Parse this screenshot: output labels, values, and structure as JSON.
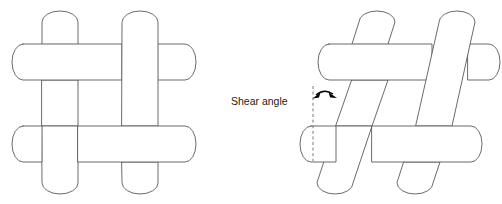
{
  "figure": {
    "canvas": {
      "width": 502,
      "height": 204,
      "background": "#ffffff"
    },
    "style": {
      "tow_fill": "#ffffff",
      "tow_stroke": "#5a5a5a",
      "tow_stroke_width": 0.9,
      "annotation_color": "#000000",
      "dashed_reference_color": "#6a6a6a",
      "text_color": "#1b1b1b"
    },
    "annotations": [
      {
        "name": "shear-angle-label",
        "text": "Shear angle",
        "x": 231,
        "y": 105,
        "font_size": 10.5
      }
    ],
    "panels": [
      {
        "name": "undeformed-plain-weave",
        "label": "",
        "shear_angle_deg": 0,
        "description": "Plain-weave unit cell of four tows, orthogonal (0 degree shear)",
        "tow_width": 36,
        "weave": "plain",
        "warp_tows": [
          {
            "name": "warp-left",
            "axis": "vertical",
            "center": 60,
            "x_min": 42,
            "x_max": 78,
            "y_min": 14,
            "y_max": 194
          },
          {
            "name": "warp-right",
            "axis": "vertical",
            "center": 140,
            "x_min": 122,
            "x_max": 158,
            "y_min": 14,
            "y_max": 194
          }
        ],
        "weft_tows": [
          {
            "name": "weft-top",
            "axis": "horizontal",
            "center": 62,
            "y_min": 44,
            "y_max": 80,
            "x_min": 12,
            "x_max": 196
          },
          {
            "name": "weft-bottom",
            "axis": "horizontal",
            "center": 144,
            "y_min": 126,
            "y_max": 162,
            "x_min": 12,
            "x_max": 196
          }
        ],
        "crossings": [
          {
            "name": "crossing-top-left",
            "over": "weft-top",
            "under": "warp-left"
          },
          {
            "name": "crossing-top-right",
            "over": "warp-right",
            "under": "weft-top"
          },
          {
            "name": "crossing-bottom-left",
            "over": "warp-left",
            "under": "weft-bottom"
          },
          {
            "name": "crossing-bottom-right",
            "over": "weft-bottom",
            "under": "warp-right"
          }
        ]
      },
      {
        "name": "sheared-plain-weave",
        "label": "",
        "shear_angle_deg": 20,
        "description": "Same plain-weave unit cell after in-plane shear; warp tows rotated, weft tows remain horizontal",
        "tow_width": 36,
        "weave": "plain",
        "warp_tows": [
          {
            "name": "warp-left-sheared",
            "axis": "tilted",
            "tilt_deg": 20,
            "x_top": 372,
            "x_bottom": 310,
            "y_min": 14,
            "y_max": 194
          },
          {
            "name": "warp-right-sheared",
            "axis": "tilted",
            "tilt_deg": 20,
            "x_top": 452,
            "x_bottom": 390,
            "y_min": 14,
            "y_max": 194
          }
        ],
        "weft_tows": [
          {
            "name": "weft-top-sheared",
            "axis": "horizontal",
            "center": 62,
            "y_min": 44,
            "y_max": 80,
            "x_min": 318,
            "x_max": 500
          },
          {
            "name": "weft-bottom-sheared",
            "axis": "horizontal",
            "center": 144,
            "y_min": 126,
            "y_max": 162,
            "x_min": 300,
            "x_max": 482
          }
        ],
        "crossings": [
          {
            "name": "crossing-top-left-sheared",
            "over": "weft-top-sheared",
            "under": "warp-left-sheared"
          },
          {
            "name": "crossing-top-right-sheared",
            "over": "warp-right-sheared",
            "under": "weft-top-sheared"
          },
          {
            "name": "crossing-bottom-left-sheared",
            "over": "warp-left-sheared",
            "under": "weft-bottom-sheared"
          },
          {
            "name": "crossing-bottom-right-sheared",
            "over": "weft-bottom-sheared",
            "under": "warp-right-sheared"
          }
        ],
        "reference_line": {
          "name": "vertical-reference-line",
          "style": "dashed",
          "x": 313,
          "y_top": 86,
          "y_bottom": 161
        },
        "angle_marker": {
          "name": "shear-angle-arc-arrow",
          "style": "double-headed-arc",
          "from": "vertical-reference-line",
          "to": "warp-left-sheared"
        }
      }
    ]
  }
}
